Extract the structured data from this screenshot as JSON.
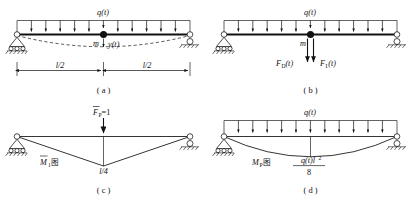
{
  "figure": {
    "panels": [
      {
        "id": "a",
        "caption": "( a )",
        "load_label": "q(t)",
        "mass_label": "m",
        "displacement_label": "y(t)",
        "dim_left": "l/2",
        "dim_right": "l/2",
        "arrow_count": 11,
        "has_deflection_curve": true,
        "left_support": "pin-support",
        "right_support": "roller-support"
      },
      {
        "id": "b",
        "caption": "( b )",
        "load_label": "q(t)",
        "mass_label": "m",
        "force_damping": "F",
        "force_damping_sub": "D",
        "force_damping_arg": "(t)",
        "force_inertia": "F",
        "force_inertia_sub": "I",
        "force_inertia_arg": "(t)",
        "arrow_count": 11,
        "has_deflection_curve": false,
        "left_support": "pin-support",
        "right_support": "roller-support"
      },
      {
        "id": "c",
        "caption": "( c )",
        "unit_load_label": "F",
        "unit_load_sub": "P",
        "unit_load_value": "=1",
        "diagram_label": "M",
        "diagram_label_sub": "1",
        "diagram_label_cjk": "图",
        "ordinate_label": "l/4",
        "diagram_type": "triangular",
        "left_support": "pin-support",
        "right_support": "roller-support"
      },
      {
        "id": "d",
        "caption": "( d )",
        "load_label": "q(t)",
        "diagram_label": "M",
        "diagram_label_sub": "P",
        "diagram_label_cjk": "图",
        "ordinate_numerator": "q(t)l",
        "ordinate_numerator_exp": "2",
        "ordinate_denominator": "8",
        "arrow_count": 11,
        "diagram_type": "parabolic",
        "left_support": "pin-support",
        "right_support": "roller-support"
      }
    ],
    "colors": {
      "ink": "#111111",
      "background": "#ffffff"
    }
  }
}
